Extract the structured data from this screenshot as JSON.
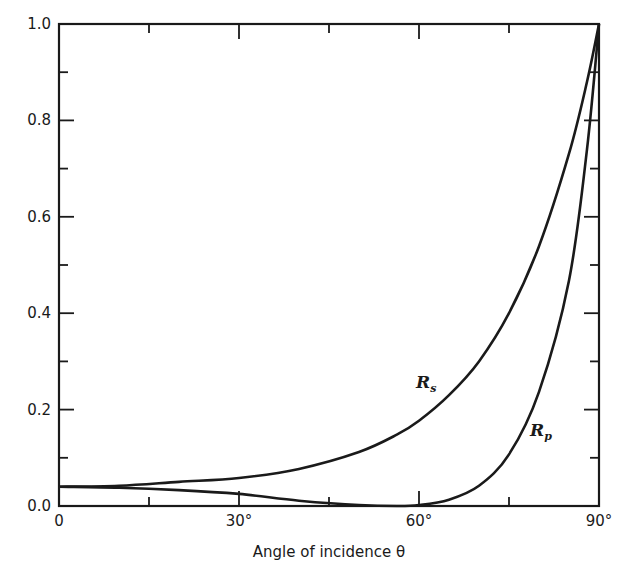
{
  "chart_data": {
    "type": "line",
    "title": "",
    "xlabel": "Angle of incidence θ",
    "ylabel": "",
    "xlim": [
      0,
      90
    ],
    "ylim": [
      0,
      1.0
    ],
    "grid": false,
    "legend": "none (curves labeled inline)",
    "x_ticks": [
      {
        "value": 0,
        "label": "0"
      },
      {
        "value": 30,
        "label": "30°"
      },
      {
        "value": 60,
        "label": "60°"
      },
      {
        "value": 90,
        "label": "90°"
      }
    ],
    "x_minor_ticks": [
      15,
      45,
      75
    ],
    "y_ticks": [
      {
        "value": 0.0,
        "label": "0.0"
      },
      {
        "value": 0.2,
        "label": "0.2"
      },
      {
        "value": 0.4,
        "label": "0.4"
      },
      {
        "value": 0.6,
        "label": "0.6"
      },
      {
        "value": 0.8,
        "label": "0.8"
      },
      {
        "value": 1.0,
        "label": "1.0"
      }
    ],
    "y_minor_ticks": [
      0.1,
      0.3,
      0.5,
      0.7,
      0.9
    ],
    "x": [
      0,
      10,
      20,
      30,
      40,
      50,
      56.3,
      60,
      65,
      70,
      75,
      80,
      85,
      88,
      90
    ],
    "series": [
      {
        "name": "Rs",
        "label": "R",
        "subscript": "s",
        "values": [
          0.04,
          0.042,
          0.05,
          0.058,
          0.077,
          0.112,
          0.148,
          0.177,
          0.23,
          0.3,
          0.4,
          0.539,
          0.731,
          0.88,
          1.0
        ],
        "label_pos": {
          "x": 59.5,
          "y": 0.245
        }
      },
      {
        "name": "Rp",
        "label": "R",
        "subscript": "p",
        "values": [
          0.04,
          0.038,
          0.033,
          0.025,
          0.011,
          0.002,
          0.0,
          0.002,
          0.013,
          0.042,
          0.107,
          0.237,
          0.468,
          0.74,
          1.0
        ],
        "label_pos": {
          "x": 78.5,
          "y": 0.145
        }
      }
    ]
  },
  "colors": {
    "line": "#1a1a1a",
    "background": "#ffffff"
  }
}
